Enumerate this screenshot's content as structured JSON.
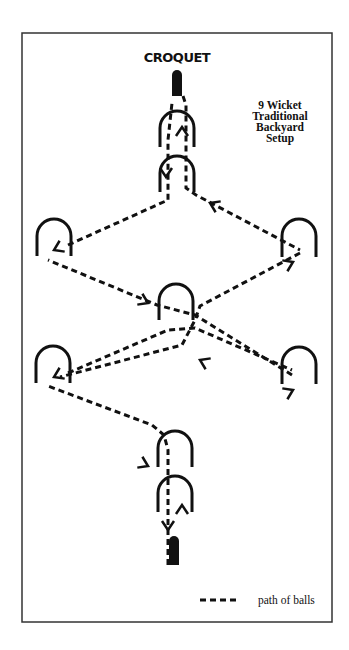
{
  "title": "CROQUET",
  "caption": [
    "9 Wicket",
    "Traditional",
    "Backyard",
    "Setup"
  ],
  "legend": {
    "label": "path of balls"
  },
  "colors": {
    "ink": "#111111",
    "border": "#333333",
    "background": "#ffffff"
  },
  "frame": {
    "x": 22,
    "y": 33,
    "width": 310,
    "height": 589
  },
  "stakes": [
    {
      "name": "top-stake",
      "x": 177,
      "y": 70,
      "w": 10,
      "h": 26
    },
    {
      "name": "bottom-stake",
      "x": 174,
      "y": 536,
      "w": 10,
      "h": 29
    }
  ],
  "wickets": [
    {
      "name": "top-wicket-1",
      "cx": 177,
      "top": 111,
      "bottom": 147
    },
    {
      "name": "top-wicket-2",
      "cx": 177,
      "top": 156,
      "bottom": 192
    },
    {
      "name": "left-wicket-upper",
      "cx": 54,
      "top": 219,
      "bottom": 256
    },
    {
      "name": "right-wicket-upper",
      "cx": 299,
      "top": 219,
      "bottom": 257
    },
    {
      "name": "center-wicket",
      "cx": 176,
      "top": 284,
      "bottom": 320
    },
    {
      "name": "left-wicket-lower",
      "cx": 53,
      "top": 346,
      "bottom": 383
    },
    {
      "name": "right-wicket-lower",
      "cx": 299,
      "top": 347,
      "bottom": 384
    },
    {
      "name": "bottom-wicket-1",
      "cx": 175,
      "top": 431,
      "bottom": 467
    },
    {
      "name": "bottom-wicket-2",
      "cx": 175,
      "top": 476,
      "bottom": 512
    }
  ],
  "paths": [
    [
      [
        168,
        565
      ],
      [
        168,
        520
      ],
      [
        168,
        450
      ],
      [
        164,
        435
      ],
      [
        152,
        425
      ],
      [
        48,
        386
      ]
    ],
    [
      [
        68,
        373
      ],
      [
        168,
        330
      ],
      [
        195,
        328
      ],
      [
        292,
        370
      ]
    ],
    [
      [
        292,
        375
      ],
      [
        195,
        315
      ],
      [
        157,
        305
      ],
      [
        48,
        260
      ]
    ],
    [
      [
        68,
        245
      ],
      [
        168,
        200
      ],
      [
        168,
        140
      ],
      [
        172,
        103
      ]
    ],
    [
      [
        183,
        96
      ],
      [
        186,
        105
      ],
      [
        186,
        150
      ],
      [
        186,
        188
      ],
      [
        196,
        195
      ],
      [
        300,
        250
      ]
    ],
    [
      [
        300,
        253
      ],
      [
        200,
        306
      ],
      [
        195,
        320
      ],
      [
        182,
        345
      ],
      [
        60,
        377
      ]
    ]
  ],
  "arrows": [
    {
      "x": 168,
      "y": 530,
      "dir": "down"
    },
    {
      "x": 182,
      "y": 505,
      "dir": "up"
    },
    {
      "x": 148,
      "y": 466,
      "dir": "right-down"
    },
    {
      "x": 54,
      "y": 377,
      "dir": "left-down"
    },
    {
      "x": 293,
      "y": 390,
      "dir": "right-up"
    },
    {
      "x": 200,
      "y": 360,
      "dir": "left-up"
    },
    {
      "x": 148,
      "y": 303,
      "dir": "right-down"
    },
    {
      "x": 54,
      "y": 250,
      "dir": "left-down"
    },
    {
      "x": 293,
      "y": 262,
      "dir": "right-up"
    },
    {
      "x": 210,
      "y": 203,
      "dir": "left-up"
    },
    {
      "x": 166,
      "y": 177,
      "dir": "down"
    },
    {
      "x": 182,
      "y": 127,
      "dir": "up"
    }
  ]
}
